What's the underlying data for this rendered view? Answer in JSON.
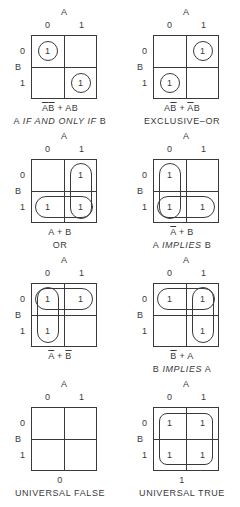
{
  "axes": {
    "col_var": "A",
    "row_var": "B",
    "col_values": [
      "0",
      "1"
    ],
    "row_values": [
      "0",
      "1"
    ]
  },
  "panels": [
    {
      "id": "iff",
      "cells": [
        [
          "1",
          ""
        ],
        [
          "",
          "1"
        ]
      ],
      "expr_parts": [
        {
          "t": "A",
          "o": true
        },
        {
          "t": "B",
          "o": true
        },
        {
          "t": " + AB",
          "o": false
        }
      ],
      "name_parts": [
        {
          "t": "A ",
          "i": false
        },
        {
          "t": "IF AND ONLY IF",
          "i": true
        },
        {
          "t": " B",
          "i": false
        }
      ]
    },
    {
      "id": "xor",
      "cells": [
        [
          "",
          "1"
        ],
        [
          "1",
          ""
        ]
      ],
      "expr_parts": [
        {
          "t": "A",
          "o": false
        },
        {
          "t": "B",
          "o": true
        },
        {
          "t": " + ",
          "o": false
        },
        {
          "t": "A",
          "o": true
        },
        {
          "t": "B",
          "o": false
        }
      ],
      "name_parts": [
        {
          "t": "EXCLUSIVE–OR",
          "i": false
        }
      ]
    },
    {
      "id": "or",
      "cells": [
        [
          "",
          "1"
        ],
        [
          "1",
          "1"
        ]
      ],
      "expr_parts": [
        {
          "t": "A + B",
          "o": false
        }
      ],
      "name_parts": [
        {
          "t": "OR",
          "i": false
        }
      ]
    },
    {
      "id": "a-implies-b",
      "cells": [
        [
          "1",
          ""
        ],
        [
          "1",
          "1"
        ]
      ],
      "expr_parts": [
        {
          "t": "A",
          "o": true
        },
        {
          "t": " + B",
          "o": false
        }
      ],
      "name_parts": [
        {
          "t": "A ",
          "i": false
        },
        {
          "t": "IMPLIES",
          "i": true
        },
        {
          "t": " B",
          "i": false
        }
      ]
    },
    {
      "id": "nand",
      "cells": [
        [
          "1",
          "1"
        ],
        [
          "1",
          ""
        ]
      ],
      "expr_parts": [
        {
          "t": "A",
          "o": true
        },
        {
          "t": " + ",
          "o": false
        },
        {
          "t": "B",
          "o": true
        }
      ],
      "name_parts": []
    },
    {
      "id": "b-implies-a",
      "cells": [
        [
          "1",
          "1"
        ],
        [
          "",
          "1"
        ]
      ],
      "expr_parts": [
        {
          "t": "B",
          "o": true
        },
        {
          "t": " + A",
          "o": false
        }
      ],
      "name_parts": [
        {
          "t": "B ",
          "i": false
        },
        {
          "t": "IMPLIES",
          "i": true
        },
        {
          "t": " A",
          "i": false
        }
      ]
    },
    {
      "id": "false",
      "cells": [
        [
          "",
          ""
        ],
        [
          "",
          ""
        ]
      ],
      "expr_parts": [
        {
          "t": "0",
          "o": false
        }
      ],
      "name_parts": [
        {
          "t": "UNIVERSAL FALSE",
          "i": false
        }
      ]
    },
    {
      "id": "true",
      "cells": [
        [
          "1",
          "1"
        ],
        [
          "1",
          "1"
        ]
      ],
      "expr_parts": [
        {
          "t": "1",
          "o": false
        }
      ],
      "name_parts": [
        {
          "t": "UNIVERSAL TRUE",
          "i": false
        }
      ]
    }
  ],
  "loops": {
    "iff": [
      {
        "type": "circle",
        "r": 0,
        "c": 0
      },
      {
        "type": "circle",
        "r": 1,
        "c": 1
      }
    ],
    "xor": [
      {
        "type": "circle",
        "r": 0,
        "c": 1
      },
      {
        "type": "circle",
        "r": 1,
        "c": 0
      }
    ],
    "or": [
      {
        "type": "vert",
        "c": 1
      },
      {
        "type": "horiz",
        "r": 1
      }
    ],
    "a-implies-b": [
      {
        "type": "vert",
        "c": 0
      },
      {
        "type": "horiz",
        "r": 1
      }
    ],
    "nand": [
      {
        "type": "vert",
        "c": 0
      },
      {
        "type": "horiz",
        "r": 0
      }
    ],
    "b-implies-a": [
      {
        "type": "horiz",
        "r": 0
      },
      {
        "type": "vert",
        "c": 1
      }
    ],
    "false": [],
    "true": [
      {
        "type": "all"
      }
    ]
  }
}
